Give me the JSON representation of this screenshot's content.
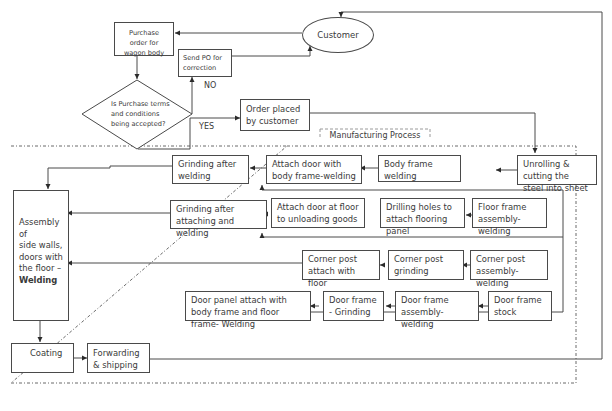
{
  "diagram": {
    "type": "flowchart",
    "nodes": {
      "customer": "Customer",
      "purchase_order": "Purchase order for wagon body",
      "send_po": "Send PO for correction",
      "decision": "Is Purchase terms and conditions being accepted?",
      "order_placed": "Order placed by customer",
      "unrolling": "Unrolling & cutting the steel into sheet",
      "body_frame_welding": "Body frame welding",
      "attach_door_body": "Attach door with body frame-welding",
      "grinding_after_welding": "Grinding after welding",
      "floor_frame_assembly": "Floor frame assembly-welding",
      "drilling_holes": "Drilling holes to attach flooring panel",
      "attach_door_floor": "Attach door at floor to unloading goods",
      "grinding_after_attaching": "Grinding after attaching and welding",
      "corner_post_assembly": "Corner post assembly-welding",
      "corner_post_grinding": "Corner post grinding",
      "corner_post_attach": "Corner post attach with floor",
      "door_frame_stock": "Door frame stock",
      "door_frame_assembly": "Door frame assembly- welding",
      "door_frame_grinding": "Door frame - Grinding",
      "door_panel_attach": "Door panel attach with body frame  and floor frame- Welding",
      "assembly_lines": [
        "Assembly of",
        "side walls,",
        "doors with",
        "the floor –"
      ],
      "assembly_bold": "Welding",
      "coating": "Coating",
      "forwarding": "Forwarding & shipping"
    },
    "edge_labels": {
      "no": "NO",
      "yes": "YES"
    },
    "group_label": "Manufacturing Process"
  },
  "colors": {
    "line": "#4a4a4a",
    "text": "#3a3a3a",
    "background": "#ffffff",
    "dashed": "#6a6a6a"
  }
}
